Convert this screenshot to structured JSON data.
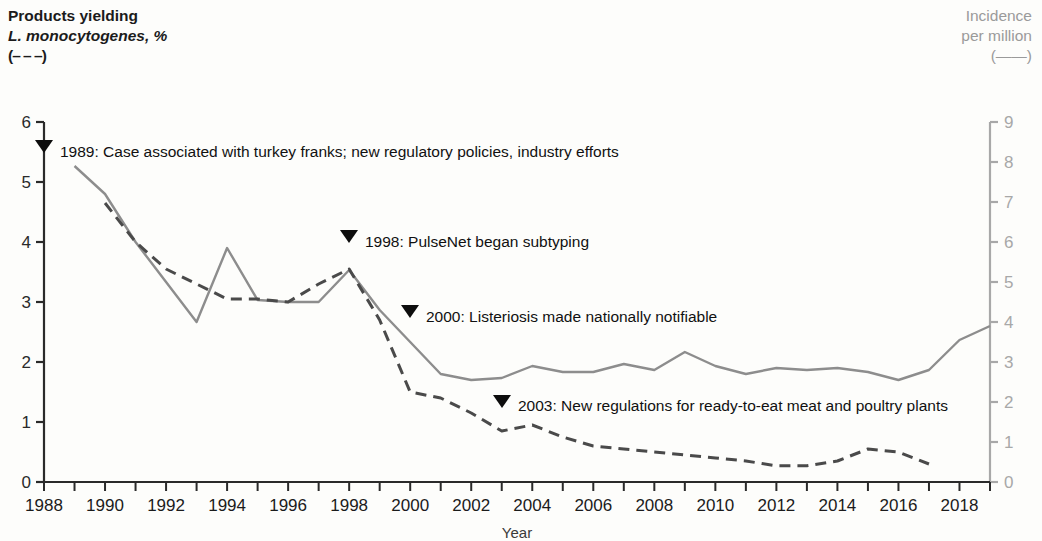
{
  "left_axis_label": {
    "line1": "Products yielding",
    "line2": "L. monocytogenes, %",
    "line3": "(– – –)"
  },
  "right_axis_label": {
    "line1": "Incidence",
    "line2": "per million",
    "line3": "(——)"
  },
  "colors": {
    "solid_line": "#8d8d8d",
    "dashed_line": "#4a4a4a",
    "left_axis": "#2a2a2a",
    "right_axis": "#a8a8a8",
    "annotation_text": "#111111",
    "background": "#fdfdfb"
  },
  "chart_data": {
    "type": "line",
    "title": "",
    "xlabel": "Year",
    "ylabel": "Products yielding L. monocytogenes, %",
    "y2label": "Incidence per million",
    "xlim": [
      1988,
      2019
    ],
    "ylim": [
      0,
      6
    ],
    "y2lim": [
      0,
      9
    ],
    "grid": false,
    "legend_position": "axis-labels",
    "xticks": [
      1988,
      1989,
      1990,
      1991,
      1992,
      1993,
      1994,
      1995,
      1996,
      1997,
      1998,
      1999,
      2000,
      2001,
      2002,
      2003,
      2004,
      2005,
      2006,
      2007,
      2008,
      2009,
      2010,
      2011,
      2012,
      2013,
      2014,
      2015,
      2016,
      2017,
      2018,
      2019
    ],
    "xticklabels": [
      "1988",
      "",
      "1990",
      "",
      "1992",
      "",
      "1994",
      "",
      "1996",
      "",
      "1998",
      "",
      "2000",
      "",
      "2002",
      "",
      "2004",
      "",
      "2006",
      "",
      "2008",
      "",
      "2010",
      "",
      "2012",
      "",
      "2014",
      "",
      "2016",
      "",
      "2018",
      ""
    ],
    "yticks": [
      0,
      1,
      2,
      3,
      4,
      5,
      6
    ],
    "yticklabels": [
      "0",
      "1",
      "2",
      "3",
      "4",
      "5",
      "6"
    ],
    "y2ticks": [
      0,
      1,
      2,
      3,
      4,
      5,
      6,
      7,
      8,
      9
    ],
    "y2ticklabels": [
      "0",
      "1",
      "2",
      "3",
      "4",
      "5",
      "6",
      "7",
      "8",
      "9"
    ],
    "series": [
      {
        "name": "Incidence per million",
        "axis": "right",
        "style": "solid",
        "color": "#8d8d8d",
        "x": [
          1989,
          1990,
          1991,
          1992,
          1993,
          1994,
          1995,
          1996,
          1997,
          1998,
          1999,
          2000,
          2001,
          2002,
          2003,
          2004,
          2005,
          2006,
          2007,
          2008,
          2009,
          2010,
          2011,
          2012,
          2013,
          2014,
          2015,
          2016,
          2017,
          2018,
          2019
        ],
        "values": [
          7.9,
          7.2,
          6.0,
          5.0,
          4.0,
          5.85,
          4.55,
          4.5,
          4.5,
          5.3,
          4.3,
          3.5,
          2.7,
          2.55,
          2.6,
          2.9,
          2.75,
          2.75,
          2.95,
          2.8,
          3.25,
          2.9,
          2.7,
          2.85,
          2.8,
          2.85,
          2.75,
          2.55,
          2.8,
          3.55,
          3.9
        ]
      },
      {
        "name": "Products yielding L. monocytogenes, %",
        "axis": "left",
        "style": "dashed",
        "color": "#4a4a4a",
        "x": [
          1990,
          1991,
          1992,
          1993,
          1994,
          1995,
          1996,
          1997,
          1998,
          1999,
          2000,
          2001,
          2002,
          2003,
          2004,
          2005,
          2006,
          2007,
          2008,
          2009,
          2010,
          2011,
          2012,
          2013,
          2014,
          2015,
          2016,
          2017
        ],
        "values": [
          4.65,
          4.0,
          3.55,
          3.3,
          3.05,
          3.05,
          3.0,
          3.3,
          3.55,
          2.7,
          1.5,
          1.4,
          1.15,
          0.85,
          0.95,
          0.75,
          0.6,
          0.55,
          0.5,
          0.45,
          0.4,
          0.35,
          0.27,
          0.27,
          0.35,
          0.55,
          0.5,
          0.3
        ]
      }
    ],
    "annotations": [
      {
        "id": "a1989",
        "marker": "▼",
        "year": 1989,
        "text": "1989: Case associated with turkey franks; new regulatory policies, industry efforts",
        "marker_x": 44,
        "marker_y": 150,
        "text_x": 60,
        "text_y": 157
      },
      {
        "id": "a1998",
        "marker": "▼",
        "year": 1998,
        "text": "1998: PulseNet began subtyping",
        "marker_x": 349,
        "marker_y": 240,
        "text_x": 365,
        "text_y": 247
      },
      {
        "id": "a2000",
        "marker": "▼",
        "year": 2000,
        "text": "2000: Listeriosis made nationally notifiable",
        "marker_x": 410,
        "marker_y": 315,
        "text_x": 426,
        "text_y": 322
      },
      {
        "id": "a2003",
        "marker": "▼",
        "year": 2003,
        "text": "2003: New regulations for ready-to-eat meat and poultry plants",
        "marker_x": 502,
        "marker_y": 405,
        "text_x": 518,
        "text_y": 411
      }
    ]
  }
}
